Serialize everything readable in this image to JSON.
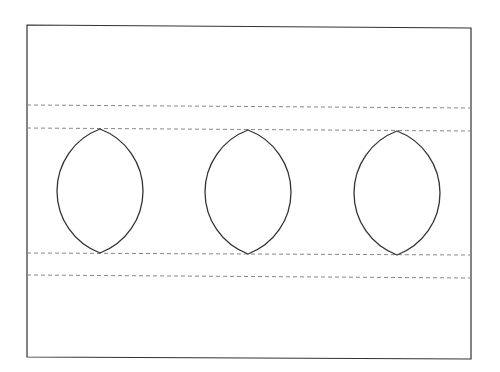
{
  "diagram": {
    "type": "lens-array",
    "frame": {
      "x1": 27,
      "y1": 25,
      "x2": 471,
      "y2": 358,
      "stroke": "#333333"
    },
    "dashed_lines": [
      {
        "y_left": 105,
        "y_right": 108
      },
      {
        "y_left": 128,
        "y_right": 131
      },
      {
        "y_left": 253,
        "y_right": 255
      },
      {
        "y_left": 275,
        "y_right": 278
      }
    ],
    "lenses": [
      {
        "cx": 100,
        "top": 129,
        "bottom": 253,
        "half_width": 43
      },
      {
        "cx": 248,
        "top": 130,
        "bottom": 254,
        "half_width": 43
      },
      {
        "cx": 397,
        "top": 131,
        "bottom": 255,
        "half_width": 43
      }
    ],
    "colors": {
      "line": "#333333",
      "dash": "#888888",
      "background": "#ffffff"
    }
  }
}
